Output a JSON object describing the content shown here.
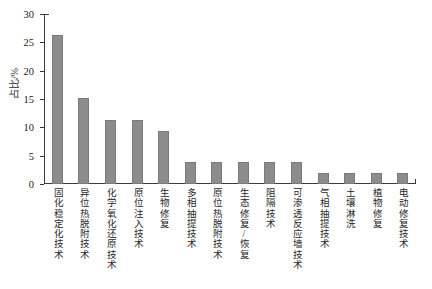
{
  "chart_data": {
    "type": "bar",
    "title": "",
    "xlabel": "",
    "ylabel": "占比/%",
    "ylim": [
      0,
      30
    ],
    "yticks": [
      0,
      5,
      10,
      15,
      20,
      25,
      30
    ],
    "grid": false,
    "legend": null,
    "bar_color": "#8c8c8c",
    "axis_color": "#3b3b3b",
    "categories": [
      "固化稳定化技术",
      "异位热脱附技术",
      "化学氧化还原技术",
      "原位注入技术",
      "生物修复",
      "多相抽提技术",
      "原位热脱附技术",
      "生态修复/恢复",
      "阻隔技术",
      "可渗透反应墙技术",
      "气相抽提技术",
      "土壤淋洗",
      "植物修复",
      "电动修复技术"
    ],
    "values": [
      26.3,
      15.1,
      11.3,
      11.3,
      9.4,
      3.8,
      3.8,
      3.8,
      3.8,
      3.8,
      1.9,
      1.9,
      1.9,
      1.9
    ]
  }
}
